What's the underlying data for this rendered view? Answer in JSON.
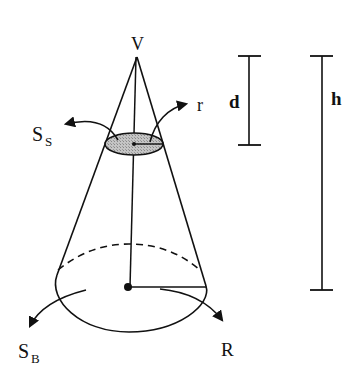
{
  "diagram": {
    "type": "cone-geometry",
    "labels": {
      "apex": "V",
      "small_radius": "r",
      "small_section_main": "S",
      "small_section_sub": "S",
      "base_main": "S",
      "base_sub": "B",
      "base_radius": "R",
      "depth": "d",
      "height": "h"
    },
    "colors": {
      "stroke": "#111111",
      "section_fill": "#b8b8b8",
      "background": "#ffffff"
    }
  }
}
